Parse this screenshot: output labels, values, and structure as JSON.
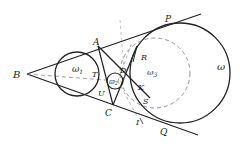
{
  "diagram": {
    "type": "geometry",
    "points": {
      "B": {
        "label": "B",
        "x": 27,
        "y": 74
      },
      "A": {
        "label": "A",
        "x": 98,
        "y": 46
      },
      "C": {
        "label": "C",
        "x": 112,
        "y": 106
      },
      "P": {
        "label": "P",
        "x": 188,
        "y": 19
      },
      "Q": {
        "label": "Q",
        "x": 186,
        "y": 127
      },
      "D": {
        "label": "D",
        "x": 123,
        "y": 71
      },
      "K": {
        "label": "K",
        "x": 136,
        "y": 85
      },
      "R": {
        "label": "R",
        "x": 140,
        "y": 56
      },
      "S": {
        "label": "S",
        "x": 146,
        "y": 102
      },
      "I": {
        "label": "I",
        "x": 138,
        "y": 121
      },
      "T": {
        "label": "T",
        "x": 98,
        "y": 75
      },
      "U": {
        "label": "U",
        "x": 102,
        "y": 93
      }
    },
    "circles": {
      "omega": {
        "label": "ω",
        "cx": 180,
        "cy": 73,
        "r": 50,
        "style": "solid"
      },
      "omega1": {
        "label": "ω",
        "sub": "1",
        "cx": 77,
        "cy": 74,
        "r": 22,
        "style": "solid"
      },
      "omega2": {
        "label": "ω",
        "sub": "2",
        "cx": 115,
        "cy": 81,
        "r": 8,
        "style": "solid"
      },
      "omega3": {
        "label": "ω",
        "sub": "3",
        "cx": 155,
        "cy": 73,
        "r": 35,
        "style": "dashed"
      }
    },
    "labels": {
      "B": "B",
      "A": "A",
      "C": "C",
      "P": "P",
      "Q": "Q",
      "D": "D",
      "K": "K",
      "R": "R",
      "S": "S",
      "I": "I",
      "T": "T",
      "U": "U",
      "omega": "ω",
      "omega1": "ω",
      "omega1_sub": "1",
      "omega2": "ω",
      "omega2_sub": "2",
      "omega3": "ω",
      "omega3_sub": "3"
    },
    "colors": {
      "stroke": "#222222",
      "dashed": "#888888",
      "background": "#ffffff"
    }
  }
}
